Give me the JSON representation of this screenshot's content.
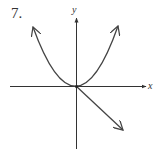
{
  "problem": {
    "number": "7."
  },
  "axes": {
    "x_label": "x",
    "y_label": "y"
  },
  "graph": {
    "curves": [
      {
        "name": "parabola",
        "description": "upward-opening parabola through origin, arrows at both ends"
      },
      {
        "name": "line",
        "description": "straight line through origin with negative slope, arrow toward lower right, starting at origin"
      }
    ],
    "colors": {
      "curve": "#444444",
      "axis": "#333333"
    }
  }
}
